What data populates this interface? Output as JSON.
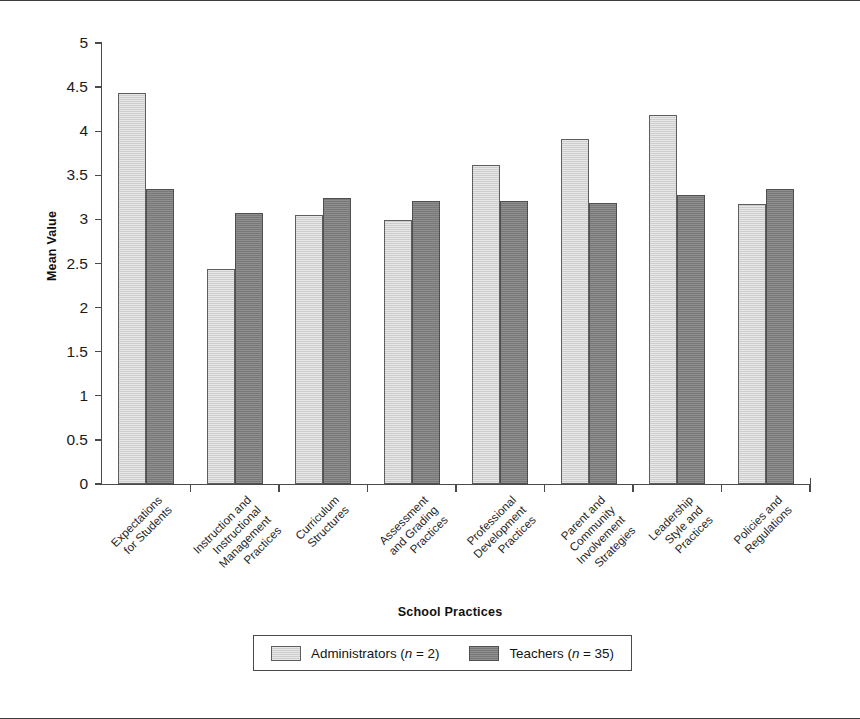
{
  "chart_data": {
    "type": "bar",
    "title": "",
    "xlabel": "School Practices",
    "ylabel": "Mean Value",
    "ylim": [
      0,
      5
    ],
    "ytick_labels": [
      "5",
      "4.5",
      "4",
      "3.5",
      "3",
      "2.5",
      "2",
      "1.5",
      "1",
      "0.5",
      "0"
    ],
    "ytick_values": [
      5,
      4.5,
      4,
      3.5,
      3,
      2.5,
      2,
      1.5,
      1,
      0.5,
      0
    ],
    "grid": false,
    "legend_position": "bottom",
    "categories": [
      "Expectations\nfor Students",
      "Instruction and\nInstructional\nManagement\nPractices",
      "Curriculum\nStructures",
      "Assessment\nand Grading\nPractices",
      "Professional\nDevelopment\nPractices",
      "Parent and\nCommunity\nInvolvement\nStrategies",
      "Leadership\nStyle and\nPractices",
      "Policies and\nRegulations"
    ],
    "series": [
      {
        "name": "Administrators (n = 2)",
        "legend_label_main": "Administrators (",
        "legend_label_italic": "n",
        "legend_label_tail": " = 2)",
        "color": "#d4d4d4",
        "values": [
          4.43,
          2.44,
          3.05,
          2.99,
          3.62,
          3.91,
          4.18,
          3.17
        ]
      },
      {
        "name": "Teachers (n = 35)",
        "legend_label_main": "Teachers (",
        "legend_label_italic": "n",
        "legend_label_tail": " = 35)",
        "color": "#808080",
        "values": [
          3.35,
          3.07,
          3.24,
          3.21,
          3.21,
          3.19,
          3.28,
          3.35
        ]
      }
    ]
  }
}
